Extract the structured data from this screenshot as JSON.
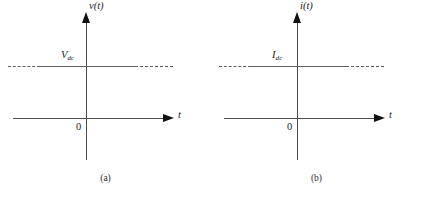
{
  "figure": {
    "panels": [
      {
        "id": "a",
        "signal_label": "v(t)",
        "level_symbol": "V",
        "level_subscript": "dc",
        "time_axis_label": "t",
        "origin_label": "0",
        "sublabel": "(a)"
      },
      {
        "id": "b",
        "signal_label": "i(t)",
        "level_symbol": "I",
        "level_subscript": "dc",
        "time_axis_label": "t",
        "origin_label": "0",
        "sublabel": "(b)"
      }
    ],
    "caption": "",
    "colors": {
      "axis": "#4d4d4d",
      "arrow": "#111111",
      "level_line": "#5d5d6b",
      "text": "#1a1a1a",
      "background": "#ffffff"
    }
  }
}
